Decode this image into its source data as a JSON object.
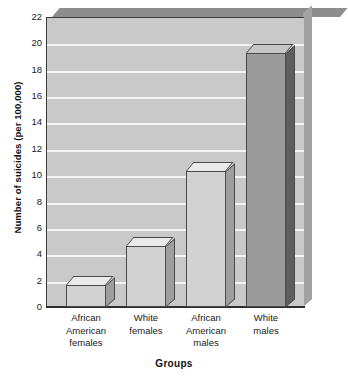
{
  "chart_data": {
    "type": "bar",
    "title": "",
    "xlabel": "Groups",
    "ylabel": "Number of suicides (per 100,000)",
    "categories": [
      "African American females",
      "White females",
      "African American males",
      "White males"
    ],
    "category_lines": [
      [
        "African",
        "American",
        "females"
      ],
      [
        "White",
        "females"
      ],
      [
        "African",
        "American",
        "males"
      ],
      [
        "White",
        "males"
      ]
    ],
    "values": [
      1.7,
      4.6,
      10.3,
      19.3
    ],
    "ylim": [
      0,
      22
    ],
    "yticks": [
      22,
      20,
      18,
      16,
      14,
      12,
      10,
      8,
      6,
      4,
      2,
      0
    ],
    "ytick_labels": [
      "22",
      "20",
      "18",
      "16",
      "14",
      "12",
      "10",
      "8",
      "6",
      "4",
      "2",
      "0"
    ],
    "grid": true,
    "legend": "none",
    "style": "3d-bar",
    "series_colors": [
      "#d2d2d2",
      "#d2d2d2",
      "#d2d2d2",
      "#9b9b9b"
    ],
    "bar_shades": [
      "light",
      "light",
      "light",
      "dark"
    ],
    "plot_background": "#c9c9c9",
    "gridline_color": "#f4f4f4",
    "axis_color": "#2e2e2e"
  }
}
